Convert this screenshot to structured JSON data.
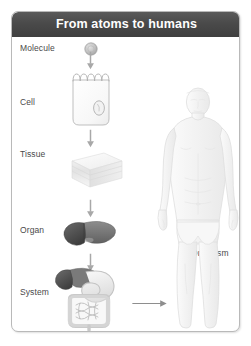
{
  "card": {
    "title": "From atoms to humans",
    "border_color": "#b9b9b9",
    "title_bar_color": "#4a4a4a",
    "title_text_color": "#ffffff",
    "background": "#ffffff"
  },
  "labels": {
    "molecule": "Molecule",
    "cell": "Cell",
    "tissue": "Tissue",
    "organ": "Organ",
    "system": "System",
    "organism": "Organism"
  },
  "icons": {
    "molecule": "molecule-sphere-icon",
    "cell": "cell-icon",
    "tissue": "tissue-slab-icon",
    "organ": "liver-organ-icon",
    "system": "digestive-system-icon",
    "organism": "human-body-icon",
    "arrow_down": "arrow-down-icon",
    "arrow_right": "arrow-right-icon"
  },
  "colors": {
    "label_text": "#4a4a4a",
    "arrow": "#a8a8a8",
    "molecule_fill": "#bdbdbd",
    "cell_fill": "#fbfbfb",
    "cell_stroke": "#b8b8b8",
    "tissue_light": "#f0f0f0",
    "tissue_mid": "#dcdcdc",
    "organ_dark": "#4f4f4f",
    "organ_mid": "#8f8f8f",
    "system_light": "#e6e6e6",
    "body_fill": "#f4f4f4",
    "body_stroke": "#e0e0e0"
  },
  "hierarchy": [
    {
      "level": 1,
      "label": "Molecule",
      "icon": "molecule-sphere-icon"
    },
    {
      "level": 2,
      "label": "Cell",
      "icon": "cell-icon"
    },
    {
      "level": 3,
      "label": "Tissue",
      "icon": "tissue-slab-icon"
    },
    {
      "level": 4,
      "label": "Organ",
      "icon": "liver-organ-icon"
    },
    {
      "level": 5,
      "label": "System",
      "icon": "digestive-system-icon"
    },
    {
      "level": 6,
      "label": "Organism",
      "icon": "human-body-icon"
    }
  ]
}
